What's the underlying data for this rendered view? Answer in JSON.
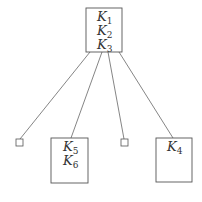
{
  "diagram": {
    "type": "tree",
    "root": {
      "keys": [
        {
          "letter": "K",
          "sub": "1"
        },
        {
          "letter": "K",
          "sub": "2"
        },
        {
          "letter": "K",
          "sub": "3"
        }
      ]
    },
    "children": [
      {
        "kind": "empty-leaf",
        "keys": []
      },
      {
        "kind": "node",
        "keys": [
          {
            "letter": "K",
            "sub": "5"
          },
          {
            "letter": "K",
            "sub": "6"
          }
        ]
      },
      {
        "kind": "empty-leaf",
        "keys": []
      },
      {
        "kind": "node",
        "keys": [
          {
            "letter": "K",
            "sub": "4"
          }
        ]
      }
    ],
    "colors": {
      "stroke": "#555555",
      "text": "#333333",
      "background": "#ffffff"
    }
  }
}
